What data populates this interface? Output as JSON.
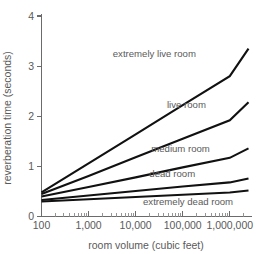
{
  "chart_data": {
    "type": "line",
    "title": "",
    "xlabel": "room volume (cubic feet)",
    "ylabel": "reverberation time (seconds)",
    "xscale": "log",
    "yscale": "linear",
    "xlim": [
      100,
      2500000
    ],
    "ylim": [
      0,
      4
    ],
    "grid": false,
    "legend_position": "inline-labels",
    "xticks": [
      100,
      1000,
      10000,
      100000,
      1000000
    ],
    "xticklabels": [
      "100",
      "1,000",
      "10,000",
      "100,000",
      "1,000,000"
    ],
    "yticks": [
      0,
      1,
      2,
      3,
      4
    ],
    "yticklabels": [
      "0",
      "1",
      "2",
      "3",
      "4"
    ],
    "x": [
      100,
      1000,
      10000,
      100000,
      1000000,
      2500000
    ],
    "series": [
      {
        "name": "extremely live room",
        "label": "extremely live room",
        "color": "#111111",
        "values": [
          0.48,
          1.06,
          1.64,
          2.22,
          2.8,
          3.35
        ],
        "label_x": 25000,
        "label_y": 3.18
      },
      {
        "name": "live room",
        "label": "live room",
        "color": "#111111",
        "values": [
          0.45,
          0.81,
          1.18,
          1.55,
          1.92,
          2.28
        ],
        "label_x": 120000,
        "label_y": 2.16
      },
      {
        "name": "medium room",
        "label": "medium room",
        "color": "#111111",
        "values": [
          0.4,
          0.59,
          0.78,
          0.98,
          1.17,
          1.36
        ],
        "label_x": 90000,
        "label_y": 1.28
      },
      {
        "name": "dead room",
        "label": "dead room",
        "color": "#111111",
        "values": [
          0.33,
          0.42,
          0.51,
          0.6,
          0.68,
          0.76
        ],
        "label_x": 60000,
        "label_y": 0.78
      },
      {
        "name": "extremely dead room",
        "label": "extremely dead room",
        "color": "#111111",
        "values": [
          0.3,
          0.345,
          0.39,
          0.435,
          0.48,
          0.52
        ],
        "label_x": 130000,
        "label_y": 0.22
      }
    ]
  },
  "figure": {
    "background_color": "#ffffff",
    "axis_color": "#6b6b6b",
    "line_color": "#111111",
    "text_color": "#5a5a5a"
  }
}
